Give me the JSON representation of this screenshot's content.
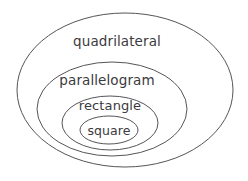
{
  "diagram": {
    "type": "nested-venn",
    "background_color": "#ffffff",
    "stroke_color": "#55545a",
    "text_color": "#3b3a3c",
    "levels": [
      {
        "id": "quadrilateral",
        "label": "quadrilateral",
        "depth": 0,
        "ellipse": {
          "cx": 125,
          "cy": 90,
          "rx": 108,
          "ry": 77
        },
        "label_pos": {
          "x": 117,
          "y": 41
        }
      },
      {
        "id": "parallelogram",
        "label": "parallelogram",
        "depth": 1,
        "ellipse": {
          "cx": 112,
          "cy": 109,
          "rx": 75,
          "ry": 47
        },
        "label_pos": {
          "x": 107,
          "y": 80
        }
      },
      {
        "id": "rectangle",
        "label": "rectangle",
        "depth": 2,
        "ellipse": {
          "cx": 110,
          "cy": 123,
          "rx": 48,
          "ry": 27
        },
        "label_pos": {
          "x": 110,
          "y": 105
        }
      },
      {
        "id": "square",
        "label": "square",
        "depth": 3,
        "ellipse": {
          "cx": 109,
          "cy": 130,
          "rx": 29,
          "ry": 14
        },
        "label_pos": {
          "x": 109,
          "y": 130
        }
      }
    ]
  }
}
